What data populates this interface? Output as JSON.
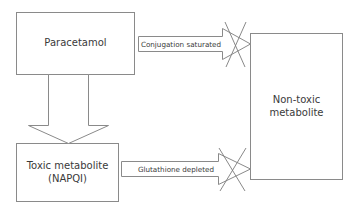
{
  "diagram": {
    "colors": {
      "stroke": "#8a8a8a",
      "cross": "#7a7a7a",
      "text": "#3a3a3a",
      "background": "#ffffff"
    },
    "nodes": [
      {
        "id": "paracetamol",
        "label": "Paracetamol"
      },
      {
        "id": "toxic_metabolite",
        "label_line1": "Toxic metabolite",
        "label_line2": "(NAPQI)"
      },
      {
        "id": "non_toxic_metabolite",
        "label_line1": "Non-toxic",
        "label_line2": "metabolite"
      }
    ],
    "edges": [
      {
        "from": "paracetamol",
        "to": "non_toxic_metabolite",
        "label": "Conjugation saturated",
        "blocked": true,
        "blocked_icon": "cross-icon"
      },
      {
        "from": "paracetamol",
        "to": "toxic_metabolite",
        "label": "",
        "blocked": false
      },
      {
        "from": "toxic_metabolite",
        "to": "non_toxic_metabolite",
        "label": "Glutathione depleted",
        "blocked": true,
        "blocked_icon": "cross-icon"
      }
    ]
  }
}
